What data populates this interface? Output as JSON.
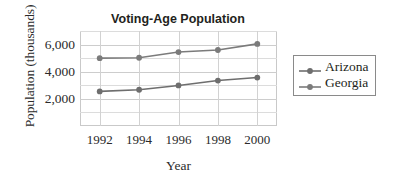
{
  "chart_data": {
    "type": "line",
    "title": "Voting-Age Population",
    "xlabel": "Year",
    "ylabel": "Population (thousands)",
    "x": [
      1992,
      1994,
      1996,
      1998,
      2000
    ],
    "xticklabels": [
      "1992",
      "1994",
      "1996",
      "1998",
      "2000"
    ],
    "yticklabels": [
      "2,000",
      "4,000",
      "6,000"
    ],
    "ytickvalues": [
      2000,
      4000,
      6000
    ],
    "ylim": [
      0,
      7000
    ],
    "xlim": [
      1991,
      2001
    ],
    "grid": true,
    "minor_gridlines": [
      1000,
      3000,
      5000,
      7000
    ],
    "legend_position": "right",
    "series": [
      {
        "name": "Arizona",
        "color": "#6e6e6e",
        "values": [
          2550,
          2670,
          2990,
          3350,
          3570
        ]
      },
      {
        "name": "Georgia",
        "color": "#7b7b7b",
        "values": [
          5000,
          5030,
          5450,
          5600,
          6050
        ]
      }
    ]
  },
  "legend": {
    "items": [
      {
        "label": "Arizona"
      },
      {
        "label": "Georgia"
      }
    ]
  },
  "colors": {
    "series_gray": "#6e6e6e",
    "gridline": "#dcdcdc",
    "frame": "#c9c9c9",
    "text": "#231f20"
  }
}
